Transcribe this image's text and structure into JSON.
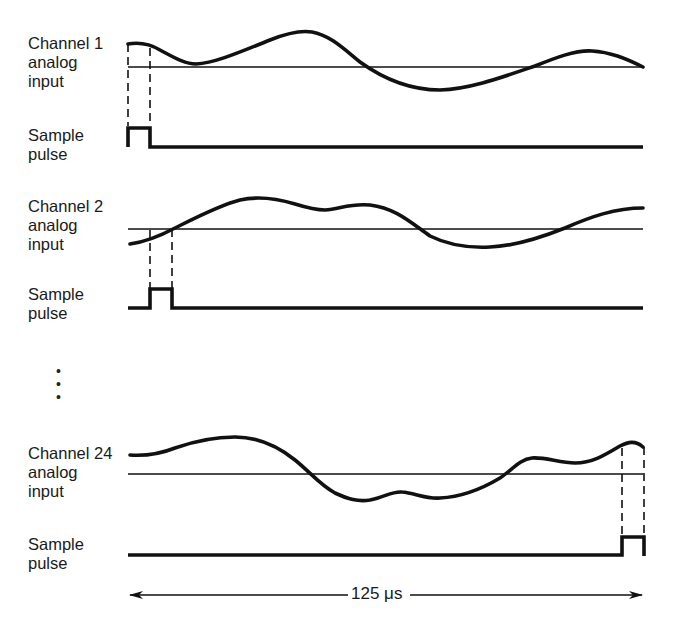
{
  "diagram": {
    "title": "",
    "channels": [
      {
        "id": "channel-1",
        "input_label": [
          "Channel 1",
          "analog",
          "input"
        ],
        "pulse_label": [
          "Sample",
          "pulse"
        ]
      },
      {
        "id": "channel-2",
        "input_label": [
          "Channel 2",
          "analog",
          "input"
        ],
        "pulse_label": [
          "Sample",
          "pulse"
        ]
      },
      {
        "id": "channel-24",
        "input_label": [
          "Channel 24",
          "analog",
          "input"
        ],
        "pulse_label": [
          "Sample",
          "pulse"
        ]
      }
    ],
    "ellipsis": "·\n·\n·",
    "frame_period_label": "125 μs",
    "colors": {
      "line": "#111111",
      "background": "#ffffff"
    }
  }
}
